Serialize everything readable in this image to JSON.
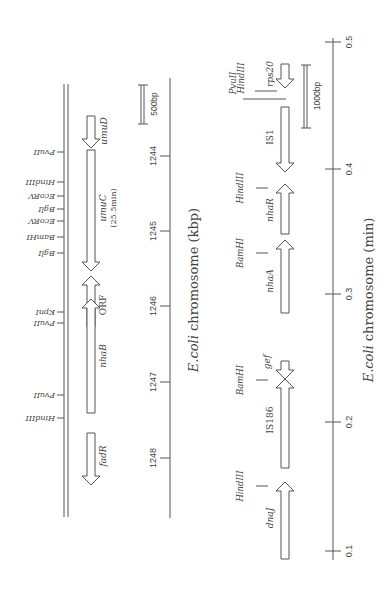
{
  "left_panel": {
    "axis_title_prefix": "E.coli",
    "axis_title_suffix": " chromosome  (kbp)",
    "scale_bar": "500bp",
    "ticks": [
      "1244",
      "1245",
      "1246",
      "1247",
      "1248"
    ],
    "sites": [
      {
        "name": "PvuII",
        "y": 152
      },
      {
        "name": "HindIII",
        "y": 182
      },
      {
        "name": "EcoRV",
        "y": 196
      },
      {
        "name": "BglI",
        "y": 209
      },
      {
        "name": "EcoRV",
        "y": 221
      },
      {
        "name": "BamHI",
        "y": 237
      },
      {
        "name": "BglI",
        "y": 253
      },
      {
        "name": "KpnI",
        "y": 312
      },
      {
        "name": "PvuII",
        "y": 323
      },
      {
        "name": "PvuII",
        "y": 395
      },
      {
        "name": "HindIII",
        "y": 418
      }
    ],
    "genes": {
      "umuD": "umuD",
      "umuC": "umuC",
      "umuC_pos": "(25.5min)",
      "orf": "ORF",
      "nhaB": "nhaB",
      "fadR": "fadR"
    }
  },
  "right_panel": {
    "axis_title_prefix": "E.coli",
    "axis_title_suffix": " chromosome  (min)",
    "scale_bar": "1000bp",
    "ticks": [
      "0.1",
      "0.2",
      "0.3",
      "0.4",
      "0.5"
    ],
    "sites": {
      "pvuII": "PvuII",
      "hindIII_top": "HindIII",
      "hindIII_nhaR": "HindIII",
      "bamHI_nhaA": "BamHI",
      "bamHI_is186": "BamHI",
      "hindIII_dnaJ": "HindIII"
    },
    "genes": {
      "rps20": "rps20",
      "is1": "IS1",
      "nhaR": "nhaR",
      "nhaA": "nhaA",
      "gef": "gef",
      "is186": "IS186",
      "dnaJ": "dnaJ"
    }
  }
}
